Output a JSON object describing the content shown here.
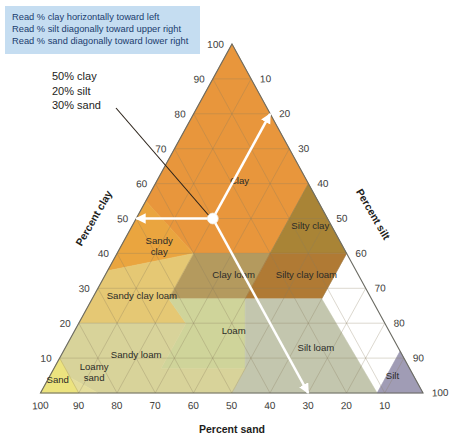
{
  "legend": {
    "lines": [
      "Read % clay horizontally toward left",
      "Read % silt diagonally toward upper right",
      "Read % sand diagonally toward lower right"
    ],
    "background_color": "#c5ddf1",
    "text_color": "#1a3c6e"
  },
  "callout": {
    "lines": [
      "50% clay",
      "20% silt",
      "30% sand"
    ],
    "point": {
      "clay": 50,
      "silt": 20,
      "sand": 30
    }
  },
  "axes": {
    "clay": {
      "title": "Percent clay",
      "ticks": [
        10,
        20,
        30,
        40,
        50,
        60,
        70,
        80,
        90,
        100
      ]
    },
    "silt": {
      "title": "Percent silt",
      "ticks": [
        10,
        20,
        30,
        40,
        50,
        60,
        70,
        80,
        90,
        100
      ]
    },
    "sand": {
      "title": "Percent sand",
      "ticks": [
        100,
        90,
        80,
        70,
        60,
        50,
        40,
        30,
        20,
        10
      ]
    }
  },
  "chart_data": {
    "type": "ternary",
    "axis_titles": {
      "left": "Percent clay",
      "right": "Percent silt",
      "bottom": "Percent sand"
    },
    "axis_ranges": {
      "clay": [
        0,
        100
      ],
      "silt": [
        0,
        100
      ],
      "sand": [
        0,
        100
      ]
    },
    "grid": true,
    "grid_step": 10,
    "legend_position": "top-left",
    "annotated_point": {
      "clay": 50,
      "silt": 20,
      "sand": 30,
      "label": "50% clay 20% silt 30% sand"
    },
    "arrows": [
      {
        "direction": "left",
        "reads": "clay"
      },
      {
        "direction": "upper-right",
        "reads": "silt"
      },
      {
        "direction": "lower-right",
        "reads": "sand"
      }
    ],
    "regions": [
      {
        "name": "Clay",
        "color": "#e8963c",
        "label_pos": {
          "clay": 60,
          "silt": 22,
          "sand": 18
        },
        "vertices": [
          [
            100,
            0,
            0
          ],
          [
            60,
            40,
            0
          ],
          [
            40,
            40,
            20
          ],
          [
            40,
            20,
            40
          ],
          [
            55,
            0,
            45
          ]
        ]
      },
      {
        "name": "Silty clay",
        "color": "#a98436",
        "label_pos": {
          "clay": 47,
          "silt": 47,
          "sand": 6
        },
        "vertices": [
          [
            60,
            40,
            0
          ],
          [
            40,
            60,
            0
          ],
          [
            40,
            40,
            20
          ]
        ]
      },
      {
        "name": "Sandy clay",
        "color": "#eaa53f",
        "label_pos": {
          "clay": 42,
          "silt": 10,
          "sand": 48
        },
        "vertices": [
          [
            55,
            0,
            45
          ],
          [
            40,
            20,
            40
          ],
          [
            35,
            0,
            65
          ]
        ]
      },
      {
        "name": "Clay loam",
        "color": "#b49a5e",
        "label_pos": {
          "clay": 33,
          "silt": 34,
          "sand": 33
        },
        "vertices": [
          [
            40,
            20,
            40
          ],
          [
            40,
            40,
            20
          ],
          [
            27,
            40,
            33
          ],
          [
            27,
            20,
            53
          ]
        ]
      },
      {
        "name": "Silty clay loam",
        "color": "#b07a34",
        "label_pos": {
          "clay": 33,
          "silt": 53,
          "sand": 14
        },
        "vertices": [
          [
            40,
            40,
            20
          ],
          [
            40,
            60,
            0
          ],
          [
            27,
            60,
            13
          ],
          [
            27,
            40,
            33
          ]
        ]
      },
      {
        "name": "Sandy clay loam",
        "color": "#e5c874",
        "label_pos": {
          "clay": 27,
          "silt": 13,
          "sand": 60
        },
        "vertices": [
          [
            35,
            0,
            65
          ],
          [
            40,
            20,
            40
          ],
          [
            27,
            20,
            53
          ],
          [
            20,
            28,
            52
          ],
          [
            20,
            0,
            80
          ]
        ]
      },
      {
        "name": "Loam",
        "color": "#cfd49a",
        "label_pos": {
          "clay": 17,
          "silt": 42,
          "sand": 41
        },
        "vertices": [
          [
            27,
            20,
            53
          ],
          [
            27,
            40,
            33
          ],
          [
            7,
            50,
            43
          ],
          [
            7,
            28,
            65
          ],
          [
            20,
            28,
            52
          ]
        ]
      },
      {
        "name": "Silt loam",
        "color": "#c3c6ae",
        "label_pos": {
          "clay": 12,
          "silt": 66,
          "sand": 22
        },
        "vertices": [
          [
            27,
            40,
            33
          ],
          [
            27,
            60,
            13
          ],
          [
            0,
            88,
            12
          ],
          [
            0,
            50,
            50
          ],
          [
            7,
            50,
            43
          ]
        ]
      },
      {
        "name": "Silt",
        "color": "#a09cb5",
        "label_pos": {
          "clay": 4,
          "silt": 90,
          "sand": 6
        },
        "vertices": [
          [
            0,
            100,
            0
          ],
          [
            0,
            88,
            12
          ],
          [
            12,
            88,
            0
          ]
        ]
      },
      {
        "name": "Sandy loam",
        "color": "#d8d39a",
        "label_pos": {
          "clay": 10,
          "silt": 20,
          "sand": 70
        },
        "vertices": [
          [
            20,
            0,
            80
          ],
          [
            20,
            28,
            52
          ],
          [
            7,
            28,
            65
          ],
          [
            7,
            50,
            43
          ],
          [
            0,
            50,
            50
          ],
          [
            0,
            15,
            85
          ],
          [
            7,
            0,
            93
          ]
        ]
      },
      {
        "name": "Loamy sand",
        "color": "#e4dd9c",
        "label_pos": {
          "clay": 6,
          "silt": 11,
          "sand": 83
        },
        "vertices": [
          [
            7,
            0,
            93
          ],
          [
            0,
            15,
            85
          ],
          [
            0,
            10,
            90
          ],
          [
            0,
            0,
            100
          ]
        ]
      },
      {
        "name": "Sand",
        "color": "#ece37f",
        "label_pos": {
          "clay": 3,
          "silt": 3,
          "sand": 94
        },
        "vertices": [
          [
            0,
            0,
            100
          ],
          [
            0,
            10,
            90
          ],
          [
            10,
            0,
            90
          ]
        ]
      }
    ]
  }
}
